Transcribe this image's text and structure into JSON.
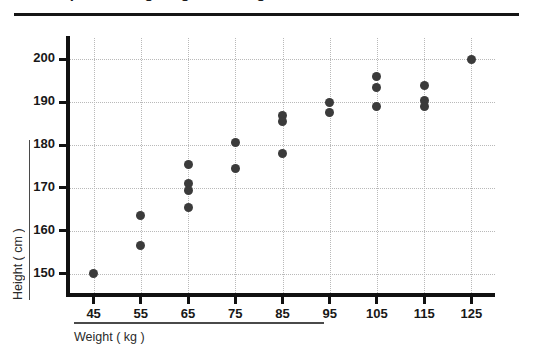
{
  "figure": {
    "title": "Scatter plot of Height against Weight",
    "title_clipped": true
  },
  "chart_data": {
    "type": "scatter",
    "title": "Scatter plot of Height against Weight",
    "xlabel": "Weight ( kg )",
    "ylabel": "Height ( cm )",
    "xlim": [
      40,
      130
    ],
    "ylim": [
      145,
      205
    ],
    "xticks": [
      45,
      55,
      65,
      75,
      85,
      95,
      105,
      115,
      125
    ],
    "yticks": [
      150,
      160,
      170,
      180,
      190,
      200
    ],
    "grid": true,
    "legend": "none",
    "marker_color": "#3b3b3b",
    "points": [
      {
        "x": 45,
        "y": 150.0
      },
      {
        "x": 55,
        "y": 163.5
      },
      {
        "x": 55,
        "y": 156.5
      },
      {
        "x": 65,
        "y": 175.5
      },
      {
        "x": 65,
        "y": 171.0
      },
      {
        "x": 65,
        "y": 169.5
      },
      {
        "x": 65,
        "y": 165.5
      },
      {
        "x": 75,
        "y": 180.5
      },
      {
        "x": 75,
        "y": 174.5
      },
      {
        "x": 85,
        "y": 187.0
      },
      {
        "x": 85,
        "y": 185.5
      },
      {
        "x": 85,
        "y": 178.0
      },
      {
        "x": 95,
        "y": 190.0
      },
      {
        "x": 95,
        "y": 187.5
      },
      {
        "x": 105,
        "y": 196.0
      },
      {
        "x": 105,
        "y": 193.5
      },
      {
        "x": 105,
        "y": 189.0
      },
      {
        "x": 115,
        "y": 194.0
      },
      {
        "x": 115,
        "y": 190.5
      },
      {
        "x": 115,
        "y": 189.0
      },
      {
        "x": 125,
        "y": 200.0
      }
    ]
  }
}
